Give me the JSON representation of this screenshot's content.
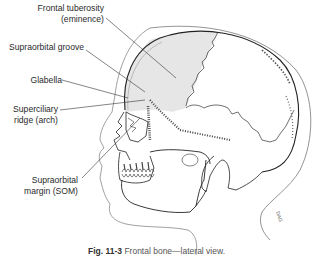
{
  "figure": {
    "labels": [
      {
        "id": "frontal-tuberosity",
        "line1": "Frontal tuberosity",
        "line2": "(eminence)"
      },
      {
        "id": "supraorbital-groove",
        "line1": "Supraorbital groove",
        "line2": ""
      },
      {
        "id": "glabella",
        "line1": "Glabella",
        "line2": ""
      },
      {
        "id": "superciliary-ridge",
        "line1": "Superciliary",
        "line2": "ridge (arch)"
      },
      {
        "id": "supraorbital-margin",
        "line1": "Supraorbital",
        "line2": "margin (SOM)"
      }
    ],
    "caption": {
      "prefix": "Fig. 11-3",
      "text": "Frontal bone—lateral view."
    },
    "colors": {
      "frontal_shading": "#e6e6e6",
      "line": "#333333",
      "label_text": "#2a2a2a"
    }
  }
}
